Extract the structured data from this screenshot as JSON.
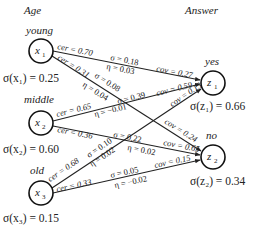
{
  "headers": {
    "input_group": "Age",
    "output_group": "Answer"
  },
  "inputs": [
    {
      "id": "x1",
      "label": "x",
      "sub": "1",
      "category": "young",
      "support": "σ(x₁) = 0.25",
      "support_value": 0.25,
      "cx": 41,
      "cy": 51
    },
    {
      "id": "x2",
      "label": "x",
      "sub": "2",
      "category": "middle",
      "support": "σ(x₂) = 0.60",
      "support_value": 0.6,
      "cx": 41,
      "cy": 123
    },
    {
      "id": "x3",
      "label": "x",
      "sub": "3",
      "category": "old",
      "support": "σ(x₃) = 0.15",
      "support_value": 0.15,
      "cx": 41,
      "cy": 193
    }
  ],
  "outputs": [
    {
      "id": "z1",
      "label": "z",
      "sub": "1",
      "category": "yes",
      "support": "σ(z₁) = 0.66",
      "support_value": 0.66,
      "cx": 213,
      "cy": 83
    },
    {
      "id": "z2",
      "label": "z",
      "sub": "2",
      "category": "no",
      "support": "σ(z₂) = 0.34",
      "support_value": 0.34,
      "cx": 213,
      "cy": 157
    }
  ],
  "edges": [
    {
      "from": "x1",
      "to": "z1",
      "cer": "cer = 0.70",
      "sigma": "σ = 0.18",
      "eta": "η = 0.03",
      "cov": "cov = 0.27"
    },
    {
      "from": "x1",
      "to": "z2",
      "cer": "cer = 0.31",
      "sigma": "σ = 0.08",
      "eta": "η = 0.04",
      "cov": "cov = 0.24"
    },
    {
      "from": "x2",
      "to": "z1",
      "cer": "cer = 0.65",
      "sigma": "σ = 0.39",
      "eta": "η = −0.01",
      "cov": "cov = 0.59"
    },
    {
      "from": "x2",
      "to": "z2",
      "cer": "cer = 0.36",
      "sigma": "σ = 0.22",
      "eta": "η = 0.02",
      "cov": "cov = 0.65"
    },
    {
      "from": "x3",
      "to": "z1",
      "cer": "cer = 0.68",
      "sigma": "σ = 0.10",
      "eta": "η = 0.02",
      "cov": "cov = 0.15"
    },
    {
      "from": "x3",
      "to": "z2",
      "cer": "cer = 0.33",
      "sigma": "σ = 0.05",
      "eta": "η = −0.02",
      "cov": "cov = 0.15"
    }
  ]
}
